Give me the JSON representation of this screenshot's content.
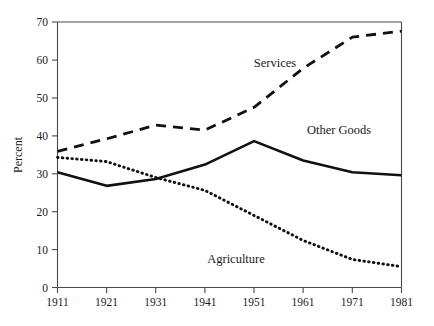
{
  "chart_data": {
    "type": "line",
    "title": "",
    "subtitle": "",
    "xlabel": "",
    "ylabel": "Percent",
    "x": [
      1911,
      1921,
      1931,
      1941,
      1951,
      1961,
      1971,
      1981
    ],
    "xtick_labels": [
      "1911",
      "1921",
      "1931",
      "1941",
      "1951",
      "1961",
      "1971",
      "1981"
    ],
    "ytick_labels": [
      "0",
      "10",
      "20",
      "30",
      "40",
      "50",
      "60",
      "70"
    ],
    "ytick_values": [
      0,
      10,
      20,
      30,
      40,
      50,
      60,
      70
    ],
    "ylim": [
      0,
      70
    ],
    "xlim": [
      1911,
      1981
    ],
    "grid": false,
    "legend_position": "inline-annotations",
    "series": [
      {
        "name": "Services",
        "style": "dashed",
        "color": "#111111",
        "values": [
          35.9,
          39.2,
          42.8,
          41.5,
          47.5,
          57.8,
          66.0,
          67.6
        ]
      },
      {
        "name": "Other Goods",
        "style": "solid",
        "color": "#111111",
        "values": [
          30.4,
          26.8,
          28.6,
          32.4,
          38.6,
          33.5,
          30.4,
          29.6
        ]
      },
      {
        "name": "Agriculture",
        "style": "dotted",
        "color": "#111111",
        "values": [
          34.3,
          33.2,
          29.0,
          25.6,
          19.0,
          12.4,
          7.4,
          5.5
        ]
      }
    ],
    "annotations": [
      {
        "text": "Services",
        "x": 1950,
        "y": 59
      },
      {
        "text": "Other Goods",
        "x": 1963,
        "y": 41.5
      },
      {
        "text": "Agriculture",
        "x": 1947,
        "y": 7.5
      }
    ]
  }
}
